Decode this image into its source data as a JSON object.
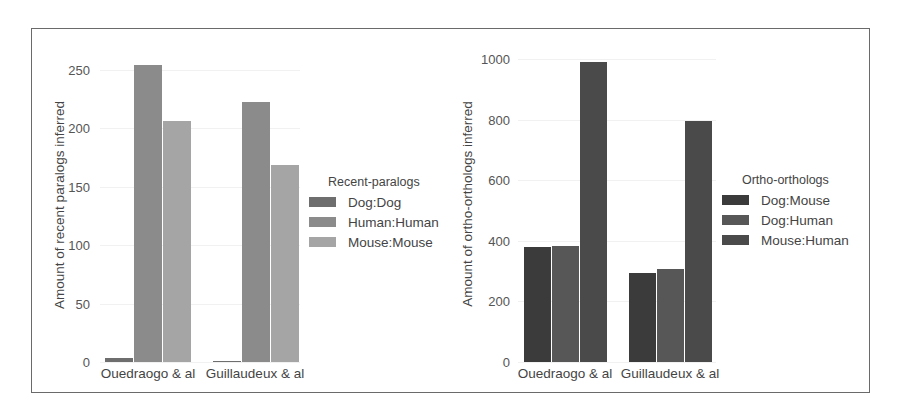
{
  "chart_data": [
    {
      "type": "bar",
      "title": "",
      "xlabel": "",
      "ylabel": "Amount of recent paralogs inferred",
      "categories": [
        "Ouedraogo & al",
        "Guillaudeux & al"
      ],
      "series": [
        {
          "name": "Dog:Dog",
          "values": [
            3,
            1
          ],
          "color": "#6e6e6e"
        },
        {
          "name": "Human:Human",
          "values": [
            254,
            223
          ],
          "color": "#8b8b8b"
        },
        {
          "name": "Mouse:Mouse",
          "values": [
            206,
            169
          ],
          "color": "#a5a5a5"
        }
      ],
      "ylim": [
        0,
        250
      ],
      "yticks": [
        "0",
        "50",
        "100",
        "150",
        "200",
        "250"
      ],
      "legend": {
        "title": "Recent-paralogs",
        "position": "right"
      },
      "grid": true
    },
    {
      "type": "bar",
      "title": "",
      "xlabel": "",
      "ylabel": "Amount of ortho-orthologs inferred",
      "categories": [
        "Ouedraogo & al",
        "Guillaudeux & al"
      ],
      "series": [
        {
          "name": "Dog:Mouse",
          "values": [
            380,
            293
          ],
          "color": "#3b3b3b"
        },
        {
          "name": "Dog:Human",
          "values": [
            384,
            308
          ],
          "color": "#575757"
        },
        {
          "name": "Mouse:Human",
          "values": [
            990,
            795
          ],
          "color": "#4a4a4a"
        }
      ],
      "ylim": [
        0,
        1000
      ],
      "yticks": [
        "0",
        "200",
        "400",
        "600",
        "800",
        "1000"
      ],
      "legend": {
        "title": "Ortho-orthologs",
        "position": "right"
      },
      "grid": true
    }
  ],
  "left": {
    "ylabel": "Amount of recent paralogs inferred",
    "yticks": [
      "0",
      "50",
      "100",
      "150",
      "200",
      "250"
    ],
    "xticks": [
      "Ouedraogo & al",
      "Guillaudeux & al"
    ],
    "legend_title": "Recent-paralogs",
    "legend": [
      "Dog:Dog",
      "Human:Human",
      "Mouse:Mouse"
    ]
  },
  "right": {
    "ylabel": "Amount of ortho-orthologs inferred",
    "yticks": [
      "0",
      "200",
      "400",
      "600",
      "800",
      "1000"
    ],
    "xticks": [
      "Ouedraogo & al",
      "Guillaudeux & al"
    ],
    "legend_title": "Ortho-orthologs",
    "legend": [
      "Dog:Mouse",
      "Dog:Human",
      "Mouse:Human"
    ]
  }
}
